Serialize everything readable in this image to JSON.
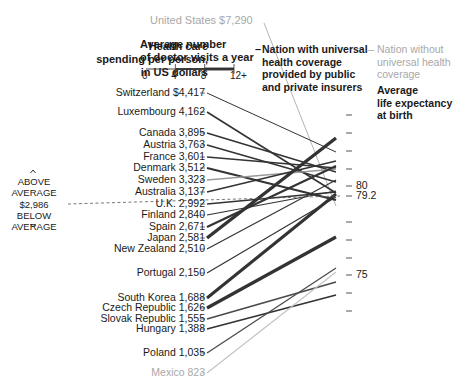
{
  "annotation": {
    "us_callout": "United States $7,290"
  },
  "headers": {
    "spending": "Health care\nspending per person,\nin US dollars",
    "spending_l1": "Health care",
    "spending_l2": "spending per person,",
    "spending_l3": "in US dollars",
    "visits_l1": "Average number",
    "visits_l2": "of doctor visits a year",
    "visits_ticks": [
      "0",
      "4",
      "8",
      "12+"
    ],
    "life_l1": "Average",
    "life_l2": "life expectancy",
    "life_l3": "at birth"
  },
  "legend": {
    "universal_dash": "–",
    "universal_l1": "Nation with universal",
    "universal_l2": "health coverage",
    "universal_l3": "provided by public",
    "universal_l4": "and private insurers",
    "non_universal_dash": "–",
    "non_universal_l1": "Nation without",
    "non_universal_l2": "universal health",
    "non_universal_l3": "coverage",
    "color_universal": "#333333",
    "color_non_universal": "#b4b4b4"
  },
  "side_notes": {
    "above_l1": "ABOVE",
    "above_l2": "AVERAGE",
    "average_value": "$2,986",
    "below_l1": "BELOW",
    "below_l2": "AVERAGE"
  },
  "right_axis": {
    "ticks": [
      {
        "label": "",
        "y": 115
      },
      {
        "label": "",
        "y": 133
      },
      {
        "label": "",
        "y": 151
      },
      {
        "label": "",
        "y": 169
      },
      {
        "label": "80",
        "y": 186
      },
      {
        "label": "79.2",
        "y": 196
      },
      {
        "label": "",
        "y": 222
      },
      {
        "label": "",
        "y": 240
      },
      {
        "label": "",
        "y": 258
      },
      {
        "label": "75",
        "y": 275
      },
      {
        "label": "",
        "y": 293
      },
      {
        "label": "",
        "y": 311
      }
    ]
  },
  "chart_data": {
    "type": "line",
    "xlabel": "",
    "ylabel": "",
    "left_axis_label": "Health care spending per person, in US dollars",
    "right_axis_label": "Average life expectancy at birth",
    "line_width_encodes": "Average number of doctor visits a year",
    "line_width_scale_ticks": [
      0,
      4,
      8,
      12
    ],
    "average_spending": 2986,
    "average_life_expectancy": 79.2,
    "right_axis_range": [
      73,
      83
    ],
    "countries": [
      {
        "name": "United States",
        "label": "United States $7,290",
        "spending": 7290,
        "life_expectancy": 78.1,
        "universal": false,
        "visits": 3.8,
        "left_y": 23,
        "right_y": 206,
        "stroke": "#b4b4b4",
        "width": 1.0
      },
      {
        "name": "Switzerland",
        "label": "Switzerland $4,417",
        "spending": 4417,
        "life_expectancy": 81.9,
        "universal": true,
        "visits": 3.4,
        "left_y": 93,
        "right_y": 152,
        "stroke": "#333333",
        "width": 1.0
      },
      {
        "name": "Luxembourg",
        "label": "Luxembourg 4,162",
        "spending": 4162,
        "life_expectancy": 79.4,
        "universal": true,
        "visits": 6.4,
        "left_y": 112,
        "right_y": 193,
        "stroke": "#333333",
        "width": 1.6
      },
      {
        "name": "Canada",
        "label": "Canada 3,895",
        "spending": 3895,
        "life_expectancy": 80.7,
        "universal": true,
        "visits": 5.8,
        "left_y": 133,
        "right_y": 172,
        "stroke": "#333333",
        "width": 1.5
      },
      {
        "name": "Austria",
        "label": "Austria 3,763",
        "spending": 3763,
        "life_expectancy": 80.1,
        "universal": true,
        "visits": 6.7,
        "left_y": 145,
        "right_y": 182,
        "stroke": "#333333",
        "width": 1.7
      },
      {
        "name": "France",
        "label": "France 3,601",
        "spending": 3601,
        "life_expectancy": 81.0,
        "universal": true,
        "visits": 6.4,
        "left_y": 157,
        "right_y": 168,
        "stroke": "#333333",
        "width": 1.6
      },
      {
        "name": "Denmark",
        "label": "Denmark 3,512",
        "spending": 3512,
        "life_expectancy": 78.8,
        "universal": true,
        "visits": 7.5,
        "left_y": 168,
        "right_y": 200,
        "stroke": "#333333",
        "width": 1.9
      },
      {
        "name": "Sweden",
        "label": "Sweden 3,323",
        "spending": 3323,
        "life_expectancy": 81.0,
        "universal": true,
        "visits": 2.8,
        "left_y": 180,
        "right_y": 169,
        "stroke": "#9a9a9a",
        "width": 1.4
      },
      {
        "name": "Australia",
        "label": "Australia 3,137",
        "spending": 3137,
        "life_expectancy": 81.4,
        "universal": true,
        "visits": 6.5,
        "left_y": 192,
        "right_y": 161,
        "stroke": "#333333",
        "width": 1.6
      },
      {
        "name": "U.K.",
        "label": "U.K. 2,992",
        "spending": 2992,
        "life_expectancy": 79.5,
        "universal": true,
        "visits": 5.0,
        "left_y": 204,
        "right_y": 192,
        "stroke": "#333333",
        "width": 1.3
      },
      {
        "name": "Finland",
        "label": "Finland 2,840",
        "spending": 2840,
        "life_expectancy": 79.5,
        "universal": true,
        "visits": 4.2,
        "left_y": 215,
        "right_y": 191,
        "stroke": "#333333",
        "width": 1.2
      },
      {
        "name": "Spain",
        "label": "Spain 2,671",
        "spending": 2671,
        "life_expectancy": 81.1,
        "universal": true,
        "visits": 8.1,
        "left_y": 227,
        "right_y": 166,
        "stroke": "#333333",
        "width": 2.1
      },
      {
        "name": "Japan",
        "label": "Japan 2,581",
        "spending": 2581,
        "life_expectancy": 82.6,
        "universal": true,
        "visits": 13.6,
        "left_y": 238,
        "right_y": 138,
        "stroke": "#333333",
        "width": 3.4
      },
      {
        "name": "New Zealand",
        "label": "New Zealand 2,510",
        "spending": 2510,
        "life_expectancy": 80.2,
        "universal": true,
        "visits": 4.3,
        "left_y": 249,
        "right_y": 180,
        "stroke": "#333333",
        "width": 1.2
      },
      {
        "name": "Portugal",
        "label": "Portugal 2,150",
        "spending": 2150,
        "life_expectancy": 79.1,
        "universal": true,
        "visits": 4.1,
        "left_y": 273,
        "right_y": 197,
        "stroke": "#333333",
        "width": 1.2
      },
      {
        "name": "South Korea",
        "label": "South Korea 1,688",
        "spending": 1688,
        "life_expectancy": 79.4,
        "universal": true,
        "visits": 11.8,
        "left_y": 298,
        "right_y": 194,
        "stroke": "#333333",
        "width": 3.0
      },
      {
        "name": "Czech Republic",
        "label": "Czech Republic 1,626",
        "spending": 1626,
        "life_expectancy": 77.0,
        "universal": true,
        "visits": 13.0,
        "left_y": 308,
        "right_y": 237,
        "stroke": "#333333",
        "width": 3.2
      },
      {
        "name": "Slovak Republic",
        "label": "Slovak Republic 1,555",
        "spending": 1555,
        "life_expectancy": 74.5,
        "universal": true,
        "visits": 11.0,
        "left_y": 319,
        "right_y": 282,
        "stroke": "#4a4a4a",
        "width": 1.8
      },
      {
        "name": "Hungary",
        "label": "Hungary 1,388",
        "spending": 1388,
        "life_expectancy": 73.8,
        "universal": true,
        "visits": 11.5,
        "left_y": 329,
        "right_y": 295,
        "stroke": "#333333",
        "width": 1.8
      },
      {
        "name": "Poland",
        "label": "Poland 1,035",
        "spending": 1035,
        "life_expectancy": 75.3,
        "universal": true,
        "visits": 6.6,
        "left_y": 353,
        "right_y": 268,
        "stroke": "#4a4a4a",
        "width": 1.3
      },
      {
        "name": "Mexico",
        "label": "Mexico 823",
        "spending": 823,
        "life_expectancy": 75.0,
        "universal": false,
        "visits": 2.5,
        "left_y": 373,
        "right_y": 272,
        "stroke": "#c2c2c2",
        "width": 1.1
      }
    ]
  }
}
